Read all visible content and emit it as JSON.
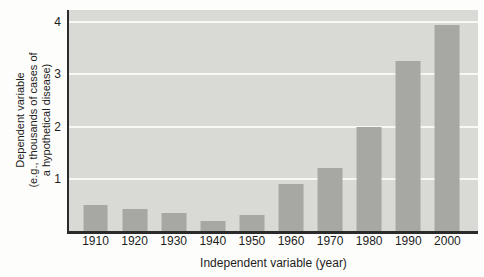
{
  "chart_data": {
    "type": "bar",
    "categories": [
      "1910",
      "1920",
      "1930",
      "1940",
      "1950",
      "1960",
      "1970",
      "1980",
      "1990",
      "2000"
    ],
    "values": [
      0.5,
      0.43,
      0.34,
      0.2,
      0.3,
      0.9,
      1.2,
      2.0,
      3.25,
      3.95
    ],
    "title": "",
    "xlabel": "Independent variable (year)",
    "ylabel": "Dependent variable (e.g., thousands of cases of a hypothetical disease)",
    "ylabel_lines": [
      "Dependent variable",
      "(e.g., thousands of cases of",
      "a hypothetical disease)"
    ],
    "yticks": [
      1,
      2,
      3,
      4
    ],
    "ylim": [
      0,
      4.23
    ],
    "grid": "horizontal white lines at integer y ticks",
    "legend": "none",
    "colors": {
      "bar": "#a7a7a4",
      "plot_background": "#d9d9d6",
      "gridline": "#f7f7f4",
      "axis": "#2b2b2b",
      "text": "#1d1d1d",
      "page_background": "#fdfdfb"
    }
  }
}
